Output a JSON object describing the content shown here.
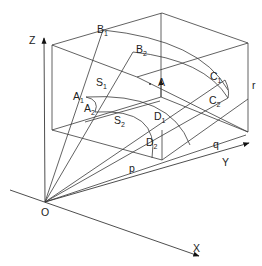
{
  "diagram": {
    "type": "3d-geometry",
    "axes": {
      "z": "Z",
      "y": "Y",
      "x": "X",
      "origin": "O"
    },
    "box_dimensions": {
      "p": "p",
      "q": "q",
      "r": "r"
    },
    "points": [
      {
        "id": "A",
        "label": "A",
        "sub": ""
      },
      {
        "id": "A1",
        "label": "A",
        "sub": "1"
      },
      {
        "id": "A2",
        "label": "A",
        "sub": "2"
      },
      {
        "id": "B1",
        "label": "B",
        "sub": "1"
      },
      {
        "id": "B2",
        "label": "B",
        "sub": "2"
      },
      {
        "id": "C1",
        "label": "C",
        "sub": "1"
      },
      {
        "id": "C2",
        "label": "C",
        "sub": "2"
      },
      {
        "id": "D1",
        "label": "D",
        "sub": "1"
      },
      {
        "id": "D2",
        "label": "D",
        "sub": "2"
      }
    ],
    "surfaces": [
      {
        "id": "S1",
        "label": "S",
        "sub": "1"
      },
      {
        "id": "S2",
        "label": "S",
        "sub": "2"
      }
    ]
  }
}
